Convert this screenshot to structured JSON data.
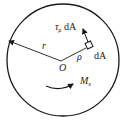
{
  "diagram": {
    "type": "shaft cross-section torsion",
    "labels": {
      "shear_force": "τ",
      "shear_sub": "ρ",
      "shear_tail": " dA",
      "element": "dA",
      "radius": "r",
      "rho": "ρ",
      "center": "O",
      "moment": "M",
      "moment_sub": "x"
    },
    "colors": {
      "stroke": "#1a1a1a",
      "background": "#ffffff"
    }
  }
}
